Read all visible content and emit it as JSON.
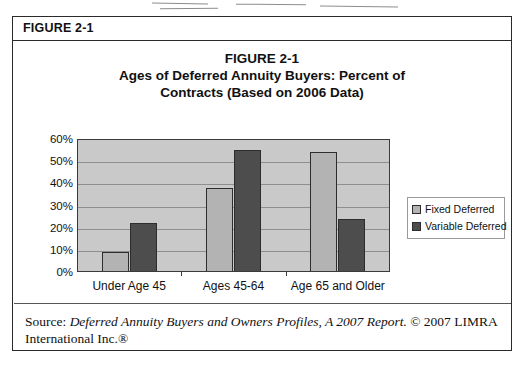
{
  "figure": {
    "header_label": "FIGURE 2-1"
  },
  "chart_title": {
    "line1": "FIGURE 2-1",
    "line2": "Ages of Deferred Annuity Buyers: Percent of",
    "line3": "Contracts (Based on 2006 Data)"
  },
  "legend": {
    "items": [
      {
        "label": "Fixed Deferred",
        "color": "#b3b3b3"
      },
      {
        "label": "Variable Deferred",
        "color": "#4d4d4d"
      }
    ]
  },
  "source": {
    "prefix": "Source: ",
    "title_italic": "Deferred Annuity Buyers and Owners Profiles, A 2007 Report.",
    "suffix": " © 2007 LIMRA International Inc.®"
  },
  "colors": {
    "plot_background": "#c9c9c9",
    "gridline": "#8e8e8e",
    "axis": "#3a3a3a",
    "bar_fixed": "#b3b3b3",
    "bar_variable": "#4d4d4d",
    "frame": "#2a2a2a"
  },
  "chart_data": {
    "type": "bar",
    "title": "FIGURE 2-1 Ages of Deferred Annuity Buyers: Percent of Contracts (Based on 2006 Data)",
    "xlabel": "",
    "ylabel": "",
    "ylim": [
      0,
      60
    ],
    "ytick_labels": [
      "60%",
      "50%",
      "40%",
      "30%",
      "20%",
      "10%",
      "0%"
    ],
    "ytick_values": [
      60,
      50,
      40,
      30,
      20,
      10,
      0
    ],
    "grid": true,
    "legend_position": "right",
    "categories": [
      "Under Age 45",
      "Ages 45-64",
      "Age 65 and Older"
    ],
    "series": [
      {
        "name": "Fixed Deferred",
        "values": [
          9,
          38,
          54
        ]
      },
      {
        "name": "Variable Deferred",
        "values": [
          22,
          55,
          24
        ]
      }
    ]
  }
}
